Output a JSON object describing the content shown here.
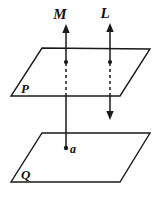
{
  "figure": {
    "type": "geometry-diagram",
    "background_color": "#ffffff",
    "ink_color": "#1a1a1a",
    "labels": {
      "line_m": "M",
      "line_l": "L",
      "plane_upper": "P",
      "plane_lower": "Q",
      "point_a": "a"
    },
    "planes": [
      {
        "name": "P",
        "label": "P",
        "role": "upper-plane",
        "points": "42,48 150,49 120,96 11,96"
      },
      {
        "name": "Q",
        "label": "Q",
        "role": "lower-plane",
        "points": "42,133 150,133 120,182 11,182"
      }
    ],
    "lines": [
      {
        "name": "M",
        "label": "M",
        "x": 66,
        "arrow_top": true,
        "arrow_bottom": false,
        "terminates_at_point": "a",
        "dot_on_plane_p": true
      },
      {
        "name": "L",
        "label": "L",
        "x": 110,
        "arrow_top": true,
        "arrow_bottom": true,
        "terminates_at_point": "",
        "dot_on_plane_p": true
      }
    ]
  }
}
